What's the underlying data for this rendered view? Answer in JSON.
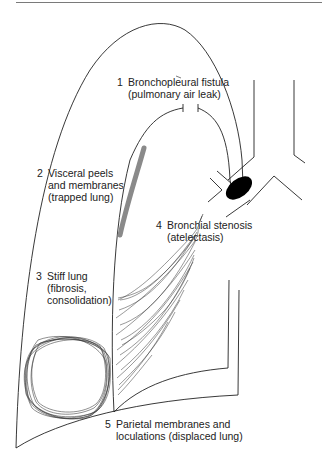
{
  "figure": {
    "type": "anatomical-diagram",
    "colors": {
      "line": "#222222",
      "visceral_peel": "#8a8a8a",
      "stenosis_plug": "#000000",
      "rule": "#7a7a7a"
    }
  },
  "labels": [
    {
      "number": "1",
      "line1": "Bronchopleural fistula",
      "line2": "(pulmonary air leak)"
    },
    {
      "number": "2",
      "line1": "Visceral peels",
      "line2": "and membranes",
      "line3": "(trapped lung)"
    },
    {
      "number": "3",
      "line1": "Stiff lung",
      "line2": "(fibrosis,",
      "line3": "consolidation)"
    },
    {
      "number": "4",
      "line1": "Bronchial stenosis",
      "line2": "(atelectasis)"
    },
    {
      "number": "5",
      "line1": "Parietal membranes and",
      "line2": "loculations (displaced lung)"
    }
  ]
}
